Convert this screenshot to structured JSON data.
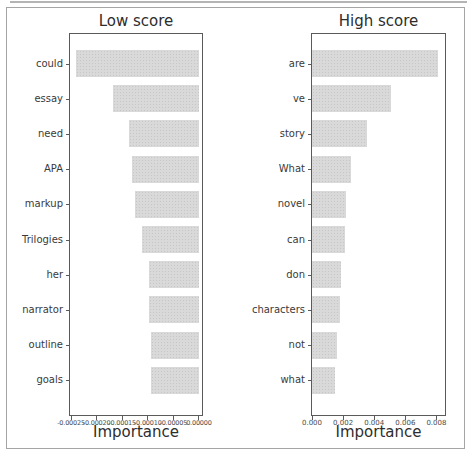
{
  "figure": {
    "background": "#ffffff",
    "frame_border_color": "#a5a5a5",
    "bar_color": "#d9d9d9",
    "spine_color": "#5a5a5a",
    "text_color": "#2d2d2d"
  },
  "chart_data": [
    {
      "type": "bar",
      "orientation": "horizontal",
      "title": "Low score",
      "xlabel": "Importance",
      "legend": "none",
      "grid": false,
      "categories": [
        "could",
        "essay",
        "need",
        "APA",
        "markup",
        "Trilogies",
        "her",
        "narrator",
        "outline",
        "goals"
      ],
      "values": [
        -0.00024,
        -0.000167,
        -0.000137,
        -0.00013,
        -0.000125,
        -0.000112,
        -9.8e-05,
        -9.68e-05,
        -9.43e-05,
        -9.29e-05
      ],
      "xlim": [
        -0.000252,
        6e-06
      ],
      "xticks": [
        -0.00025,
        -0.0002,
        -0.00015,
        -0.0001,
        -5e-05,
        0
      ],
      "xtick_labels": [
        "-0.00025",
        "-0.00020",
        "-0.00015",
        "-0.00010",
        "-0.00005",
        "0.00000"
      ]
    },
    {
      "type": "bar",
      "orientation": "horizontal",
      "title": "High score",
      "xlabel": "Importance",
      "legend": "none",
      "grid": false,
      "categories": [
        "are",
        "ve",
        "story",
        "What",
        "novel",
        "can",
        "don",
        "characters",
        "not",
        "what"
      ],
      "values": [
        0.0081,
        0.0051,
        0.00355,
        0.00253,
        0.00217,
        0.00209,
        0.00189,
        0.00179,
        0.00158,
        0.00147
      ],
      "xlim": [
        0,
        0.00855
      ],
      "xticks": [
        0,
        0.002,
        0.004,
        0.006,
        0.008
      ],
      "xtick_labels": [
        "0.000",
        "0.002",
        "0.004",
        "0.006",
        "0.008"
      ]
    }
  ]
}
